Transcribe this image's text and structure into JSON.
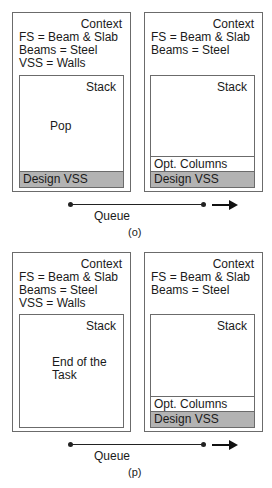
{
  "figures": [
    {
      "caption": "(o)",
      "queue_label": "Queue",
      "left": {
        "context_title": "Context",
        "context_lines": [
          "FS = Beam & Slab",
          "Beams = Steel",
          "VSS = Walls"
        ],
        "stack_title": "Stack",
        "stack_note_lines": [
          "Pop"
        ],
        "stack_items": [
          {
            "label": "Design VSS",
            "shaded": true
          }
        ]
      },
      "right": {
        "context_title": "Context",
        "context_lines": [
          "FS = Beam & Slab",
          "Beams = Steel"
        ],
        "stack_title": "Stack",
        "stack_note_lines": [],
        "stack_items": [
          {
            "label": "Opt. Columns",
            "shaded": false
          },
          {
            "label": "Design VSS",
            "shaded": true
          }
        ]
      }
    },
    {
      "caption": "(p)",
      "queue_label": "Queue",
      "left": {
        "context_title": "Context",
        "context_lines": [
          "FS = Beam & Slab",
          "Beams = Steel",
          "VSS = Walls"
        ],
        "stack_title": "Stack",
        "stack_note_lines": [
          "End of the",
          "Task"
        ],
        "stack_items": []
      },
      "right": {
        "context_title": "Context",
        "context_lines": [
          "FS = Beam & Slab",
          "Beams = Steel"
        ],
        "stack_title": "Stack",
        "stack_note_lines": [],
        "stack_items": [
          {
            "label": "Opt. Columns",
            "shaded": false
          },
          {
            "label": "Design VSS",
            "shaded": true
          }
        ]
      }
    }
  ],
  "colors": {
    "border": "#6b6b6b",
    "shaded_slot": "#b3b3b3",
    "line": "#222222"
  }
}
